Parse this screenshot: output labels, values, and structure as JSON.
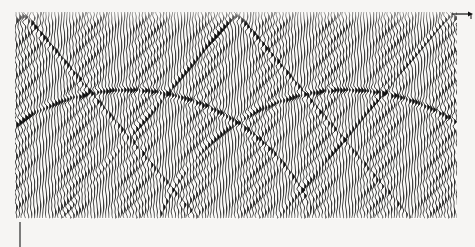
{
  "figure": {
    "name": "seismic-wiggle-trace-display",
    "background_color": "#f6f5f3",
    "ink_color": "#101010",
    "paper_color": "#fbfaf8",
    "width": 475,
    "height": 247
  },
  "panel": {
    "left": 15,
    "top": 12,
    "right": 457,
    "bottom": 219,
    "trace_spacing_px": 3,
    "trace_count": 148,
    "wavelet_half_width_px": 4,
    "wiggle_amplitude_px": 2.6,
    "fill_side": "positive"
  },
  "annotations": {
    "axis_arrow": {
      "name": "x-axis-arrow",
      "x1": 452,
      "y1": 14,
      "x2": 473,
      "y2": 14,
      "head": "right",
      "label": ""
    },
    "tick_mark": {
      "name": "bottom-left-tick",
      "x": 20,
      "y1": 222,
      "y2": 247,
      "label": ""
    },
    "corner_tick": {
      "name": "arrow-end-tick",
      "x": 471,
      "y1": 14,
      "y2": 19,
      "label": ""
    }
  },
  "chart_data": {
    "type": "line",
    "title": "",
    "subtitle": "",
    "xlabel": "",
    "ylabel": "",
    "xlim": [
      0,
      148
    ],
    "ylim": [
      0,
      207
    ],
    "grid": false,
    "legend_position": "none",
    "render": "seismic-variable-area-wiggle",
    "diffractors": [
      {
        "name": "scatterer-left",
        "apex_trace": 2,
        "apex_y": 16,
        "velocity_px_per_trace": 3.55,
        "polarity": "positive",
        "strength": 1.0
      },
      {
        "name": "scatterer-center",
        "apex_trace": 73,
        "apex_y": 16,
        "velocity_px_per_trace": 3.55,
        "polarity": "positive",
        "strength": 1.0
      },
      {
        "name": "scatterer-right",
        "apex_trace": 145,
        "apex_y": 16,
        "velocity_px_per_trace": 3.55,
        "polarity": "positive",
        "strength": 1.0
      }
    ],
    "secondary_events": [
      {
        "name": "upward-arc-left",
        "center_trace": 37,
        "center_y": 300,
        "radius_y": 210,
        "radius_trace": 68,
        "strength": 0.8
      },
      {
        "name": "upward-arc-center",
        "center_trace": 110,
        "center_y": 300,
        "radius_y": 210,
        "radius_trace": 68,
        "strength": 0.8
      }
    ],
    "series": [
      {
        "name": "diffraction-hyperbola-left",
        "comment": "traveltime curve t(x) = sqrt(t0^2 + (x-x0)^2 / v^2) for apex at trace 2",
        "x": [
          2,
          12,
          22,
          32,
          42,
          52,
          62,
          72,
          82,
          92,
          102,
          112,
          122,
          132,
          142
        ],
        "values": [
          16,
          20,
          32,
          49,
          67,
          85,
          104,
          123,
          142,
          161,
          180,
          199,
          218,
          237,
          256
        ]
      },
      {
        "name": "diffraction-hyperbola-center",
        "comment": "apex at trace 73",
        "x": [
          3,
          13,
          23,
          33,
          43,
          53,
          63,
          73,
          83,
          93,
          103,
          113,
          123,
          133,
          143
        ],
        "values": [
          149,
          131,
          112,
          93,
          74,
          56,
          39,
          16,
          39,
          56,
          74,
          93,
          112,
          131,
          149
        ]
      },
      {
        "name": "diffraction-hyperbola-right",
        "comment": "apex at trace 145",
        "x": [
          5,
          15,
          25,
          35,
          45,
          55,
          65,
          75,
          85,
          95,
          105,
          115,
          125,
          135,
          145
        ],
        "values": [
          263,
          244,
          225,
          206,
          187,
          169,
          150,
          131,
          113,
          94,
          76,
          58,
          41,
          25,
          16
        ]
      },
      {
        "name": "upward-arc-left",
        "comment": "concave-down event, apex near trace 37",
        "x": [
          3,
          13,
          23,
          33,
          37,
          43,
          53,
          63,
          73,
          83
        ],
        "values": [
          182,
          148,
          127,
          117,
          116,
          120,
          136,
          163,
          200,
          248
        ]
      },
      {
        "name": "upward-arc-center",
        "comment": "concave-down event, apex near trace 110",
        "x": [
          76,
          86,
          96,
          106,
          110,
          116,
          126,
          136,
          146
        ],
        "values": [
          182,
          148,
          127,
          117,
          116,
          120,
          136,
          163,
          200
        ]
      }
    ]
  }
}
